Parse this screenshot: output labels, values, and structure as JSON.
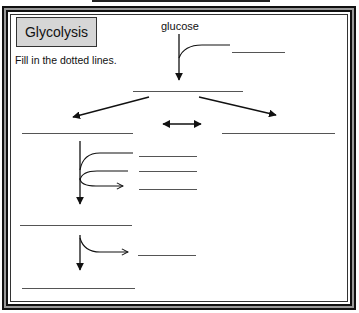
{
  "worksheet": {
    "title": "Glycolysis",
    "instruction": "Fill in the dotted lines.",
    "start_label": "glucose",
    "accent_colors": {
      "title_fill": "#d6d6d6",
      "ink": "#111111",
      "frame_gray": "#9a9a9a"
    },
    "blanks": [
      {
        "id": "glucose-branch-product",
        "value": ""
      },
      {
        "id": "after-glucose",
        "value": ""
      },
      {
        "id": "left-split-product",
        "value": ""
      },
      {
        "id": "right-split-product",
        "value": ""
      },
      {
        "id": "branch-1a",
        "value": ""
      },
      {
        "id": "branch-1b",
        "value": ""
      },
      {
        "id": "branch-1c",
        "value": ""
      },
      {
        "id": "middle-product",
        "value": ""
      },
      {
        "id": "branch-2",
        "value": ""
      },
      {
        "id": "final-product",
        "value": ""
      }
    ]
  }
}
